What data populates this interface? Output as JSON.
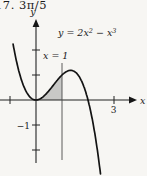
{
  "header": {
    "exercise_answer": "17. 3π/5"
  },
  "figure": {
    "equation": {
      "p1": "y = 2x",
      "sup1": "2",
      "p2": " − x",
      "sup2": "3"
    },
    "region_label": "x = 1",
    "axis_labels": {
      "x": "x",
      "y": "y"
    },
    "tick_labels": {
      "x3": "3",
      "yneg1": "−1"
    }
  },
  "chart_data": {
    "type": "line",
    "expression": "y = 2x^2 - x^3",
    "coeff_x2": 2,
    "coeff_x3": -1,
    "x_domain": [
      -0.88,
      2.49
    ],
    "roots": [
      0,
      2
    ],
    "local_min": [
      0,
      0
    ],
    "local_max": [
      1.3333,
      1.1852
    ],
    "shaded_region": {
      "x_from": 0,
      "x_to": 1,
      "description": "area between curve and x-axis, bounded right by line x = 1"
    },
    "boundary_line_x": 1,
    "ticks": {
      "x": [
        -1,
        3
      ],
      "y": [
        2,
        1,
        -1,
        -2
      ]
    },
    "labeled_ticks": {
      "x": [
        3
      ],
      "y": [
        -1
      ]
    },
    "xlabel": "x",
    "ylabel": "y",
    "xlim": [
      -1.4,
      3.9
    ],
    "ylim": [
      -3.1,
      3.2
    ],
    "grid": false,
    "legend": false,
    "layout": {
      "origin_px": [
        36,
        100
      ],
      "px_per_unit": [
        26,
        25
      ],
      "vline_y_px": [
        63,
        160
      ],
      "x_axis_px_span": [
        0,
        131
      ],
      "y_axis_px_span": [
        26,
        163
      ]
    }
  },
  "colors": {
    "background": "#f7f6f3",
    "ink": "#1b1b1b",
    "shade": "#c8c8c6"
  }
}
